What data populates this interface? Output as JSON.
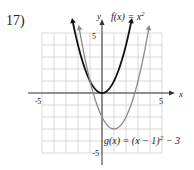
{
  "problem": {
    "number": "17)"
  },
  "chart_data": {
    "type": "line",
    "title": "",
    "xlabel": "x",
    "ylabel": "y",
    "xlim": [
      -5,
      5
    ],
    "ylim": [
      -5,
      5
    ],
    "grid": true,
    "tick_labels": {
      "x": [
        "-5",
        "5"
      ],
      "y": [
        "5",
        "-5"
      ]
    },
    "series": [
      {
        "name": "f(x) = x²",
        "label_text": "f(x) = x",
        "label_sup": "2",
        "color": "#111111",
        "formula": "x^2",
        "vertex": [
          0,
          0
        ],
        "x_range": [
          -2.45,
          2.45
        ]
      },
      {
        "name": "g(x) = (x − 1)² − 3",
        "label_text": "g(x) = (x − 1)",
        "label_sup": "2",
        "label_tail": " − 3",
        "color": "#8a8a8a",
        "formula": "(x-1)^2-3",
        "vertex": [
          1,
          -3
        ],
        "x_range": [
          -1.9,
          3.9
        ]
      }
    ],
    "colors": {
      "grid": "#cfcfcf",
      "axis": "#333333"
    }
  }
}
